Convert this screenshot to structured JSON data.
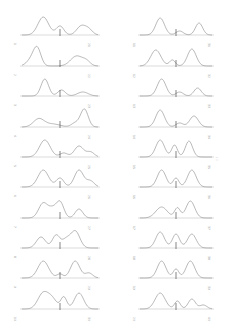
{
  "page": {
    "orientation": "rotated-figure-page",
    "background": "#ffffff",
    "trace_color": "#8a8a8a",
    "marker_color": "#333333",
    "page_marker": ": :"
  },
  "figure": {
    "columns": [
      {
        "x0": 22,
        "x1": 78,
        "panels": [
          {
            "y": 35,
            "left_label": "1",
            "right_label": "21",
            "peaks": [
              [
                0.28,
                0.9,
                0.07
              ],
              [
                0.5,
                0.45,
                0.05
              ],
              [
                0.78,
                0.45,
                0.06
              ],
              [
                0.88,
                0.25,
                0.05
              ]
            ]
          },
          {
            "y": 66,
            "left_label": "2",
            "right_label": "22",
            "peaks": [
              [
                0.2,
                0.85,
                0.05
              ],
              [
                0.12,
                0.3,
                0.06
              ],
              [
                0.72,
                0.5,
                0.08
              ],
              [
                0.85,
                0.2,
                0.05
              ]
            ]
          },
          {
            "y": 96,
            "left_label": "3",
            "right_label": "23",
            "peaks": [
              [
                0.3,
                0.85,
                0.05
              ],
              [
                0.52,
                0.3,
                0.05
              ],
              [
                0.8,
                0.2,
                0.07
              ]
            ]
          },
          {
            "y": 127,
            "left_label": "4",
            "right_label": "24",
            "peaks": [
              [
                0.22,
                0.4,
                0.07
              ],
              [
                0.4,
                0.15,
                0.1
              ],
              [
                0.82,
                0.9,
                0.05
              ],
              [
                0.7,
                0.2,
                0.05
              ]
            ]
          },
          {
            "y": 157,
            "left_label": "5",
            "right_label": "25",
            "peaks": [
              [
                0.3,
                0.85,
                0.07
              ],
              [
                0.55,
                0.2,
                0.05
              ],
              [
                0.75,
                0.55,
                0.06
              ],
              [
                0.9,
                0.25,
                0.05
              ]
            ]
          },
          {
            "y": 187,
            "left_label": "6",
            "right_label": "26",
            "peaks": [
              [
                0.28,
                0.85,
                0.07
              ],
              [
                0.5,
                0.45,
                0.05
              ],
              [
                0.75,
                0.85,
                0.06
              ],
              [
                0.9,
                0.3,
                0.05
              ]
            ]
          },
          {
            "y": 218,
            "left_label": "7",
            "right_label": "27",
            "peaks": [
              [
                0.28,
                0.75,
                0.06
              ],
              [
                0.5,
                0.8,
                0.05
              ],
              [
                0.75,
                0.45,
                0.05
              ],
              [
                0.4,
                0.4,
                0.05
              ]
            ]
          },
          {
            "y": 248,
            "left_label": "8",
            "right_label": "28",
            "peaks": [
              [
                0.25,
                0.55,
                0.06
              ],
              [
                0.45,
                0.65,
                0.05
              ],
              [
                0.7,
                0.85,
                0.06
              ],
              [
                0.58,
                0.4,
                0.05
              ]
            ]
          },
          {
            "y": 278,
            "left_label": "9",
            "right_label": "29",
            "peaks": [
              [
                0.28,
                0.85,
                0.07
              ],
              [
                0.5,
                0.2,
                0.04
              ],
              [
                0.7,
                0.85,
                0.06
              ],
              [
                0.88,
                0.25,
                0.05
              ]
            ]
          },
          {
            "y": 309,
            "left_label": "10",
            "right_label": "30",
            "peaks": [
              [
                0.28,
                0.8,
                0.07
              ],
              [
                0.55,
                0.6,
                0.04
              ],
              [
                0.75,
                0.8,
                0.06
              ],
              [
                0.4,
                0.45,
                0.06
              ]
            ]
          }
        ]
      },
      {
        "x0": 140,
        "x1": 192,
        "panels": [
          {
            "y": 35,
            "left_label": "11",
            "right_label": "31",
            "peaks": [
              [
                0.28,
                0.85,
                0.06
              ],
              [
                0.55,
                0.2,
                0.05
              ],
              [
                0.82,
                0.6,
                0.05
              ]
            ]
          },
          {
            "y": 66,
            "left_label": "12",
            "right_label": "32",
            "peaks": [
              [
                0.22,
                0.8,
                0.07
              ],
              [
                0.45,
                0.3,
                0.04
              ],
              [
                0.72,
                0.85,
                0.06
              ]
            ]
          },
          {
            "y": 96,
            "left_label": "13",
            "right_label": "33",
            "peaks": [
              [
                0.3,
                0.85,
                0.06
              ],
              [
                0.55,
                0.2,
                0.05
              ],
              [
                0.8,
                0.4,
                0.05
              ]
            ]
          },
          {
            "y": 127,
            "left_label": "14",
            "right_label": "34",
            "peaks": [
              [
                0.28,
                0.85,
                0.06
              ],
              [
                0.55,
                0.2,
                0.05
              ],
              [
                0.75,
                0.55,
                0.06
              ]
            ]
          },
          {
            "y": 157,
            "left_label": "15",
            "right_label": "35",
            "peaks": [
              [
                0.28,
                0.85,
                0.06
              ],
              [
                0.48,
                0.6,
                0.04
              ],
              [
                0.68,
                0.8,
                0.05
              ]
            ]
          },
          {
            "y": 187,
            "left_label": "16",
            "right_label": "36",
            "peaks": [
              [
                0.3,
                0.85,
                0.06
              ],
              [
                0.5,
                0.45,
                0.04
              ],
              [
                0.72,
                0.85,
                0.06
              ]
            ]
          },
          {
            "y": 218,
            "left_label": "17",
            "right_label": "37",
            "peaks": [
              [
                0.3,
                0.55,
                0.08
              ],
              [
                0.52,
                0.5,
                0.04
              ],
              [
                0.7,
                0.85,
                0.06
              ]
            ]
          },
          {
            "y": 248,
            "left_label": "18",
            "right_label": "38",
            "peaks": [
              [
                0.28,
                0.8,
                0.06
              ],
              [
                0.5,
                0.7,
                0.05
              ],
              [
                0.72,
                0.7,
                0.06
              ]
            ]
          },
          {
            "y": 278,
            "left_label": "19",
            "right_label": "39",
            "peaks": [
              [
                0.3,
                0.85,
                0.06
              ],
              [
                0.5,
                0.45,
                0.04
              ],
              [
                0.7,
                0.85,
                0.06
              ]
            ]
          },
          {
            "y": 309,
            "left_label": "20",
            "right_label": "40",
            "peaks": [
              [
                0.28,
                0.8,
                0.07
              ],
              [
                0.52,
                0.4,
                0.04
              ],
              [
                0.72,
                0.5,
                0.05
              ],
              [
                0.88,
                0.2,
                0.05
              ]
            ]
          }
        ]
      }
    ]
  }
}
